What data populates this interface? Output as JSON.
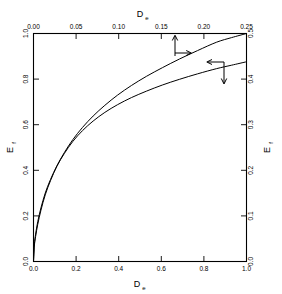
{
  "chart_data": {
    "type": "line",
    "title": "",
    "subtitle": "",
    "axes": {
      "bottom": {
        "label": "D",
        "label_sub": "e",
        "ticks": [
          "0.0",
          "0.2",
          "0.4",
          "0.6",
          "0.8",
          "1.0"
        ],
        "tick_values": [
          0.0,
          0.2,
          0.4,
          0.6,
          0.8,
          1.0
        ],
        "lim": [
          0.0,
          1.0
        ]
      },
      "top": {
        "label": "D",
        "label_sub": "e",
        "ticks": [
          "0.00",
          "0.05",
          "0.10",
          "0.15",
          "0.20",
          "0.25"
        ],
        "tick_values": [
          0.0,
          0.05,
          0.1,
          0.15,
          0.2,
          0.25
        ],
        "lim": [
          0.0,
          0.25
        ]
      },
      "left": {
        "label": "E",
        "label_sub": "f",
        "ticks": [
          "0.0",
          "0.2",
          "0.4",
          "0.6",
          "0.8",
          "1.0"
        ],
        "tick_values": [
          0.0,
          0.2,
          0.4,
          0.6,
          0.8,
          1.0
        ],
        "lim": [
          0.0,
          1.0
        ]
      },
      "right": {
        "label": "E",
        "label_sub": "f",
        "ticks": [
          "0.0",
          "0.1",
          "0.2",
          "0.3",
          "0.4",
          "0.5"
        ],
        "tick_values": [
          0.0,
          0.1,
          0.2,
          0.3,
          0.4,
          0.5
        ],
        "lim": [
          0.0,
          0.5
        ]
      }
    },
    "grid": false,
    "legend": null,
    "series": [
      {
        "name": "upper-curve",
        "axes_ref": "bottom-left",
        "x": [
          0.0,
          0.004,
          0.01,
          0.02,
          0.035,
          0.055,
          0.08,
          0.11,
          0.145,
          0.185,
          0.23,
          0.28,
          0.335,
          0.395,
          0.46,
          0.53,
          0.605,
          0.685,
          0.77,
          0.86,
          0.93,
          1.0
        ],
        "y": [
          0.0,
          0.075,
          0.12,
          0.175,
          0.235,
          0.3,
          0.36,
          0.42,
          0.478,
          0.535,
          0.588,
          0.638,
          0.685,
          0.73,
          0.772,
          0.812,
          0.85,
          0.888,
          0.925,
          0.962,
          0.982,
          1.0
        ]
      },
      {
        "name": "lower-curve",
        "axes_ref": "bottom-left",
        "x": [
          0.0,
          0.004,
          0.01,
          0.02,
          0.035,
          0.055,
          0.08,
          0.11,
          0.145,
          0.185,
          0.23,
          0.28,
          0.335,
          0.395,
          0.46,
          0.53,
          0.605,
          0.685,
          0.77,
          0.86,
          0.93,
          1.0
        ],
        "y": [
          0.0,
          0.068,
          0.11,
          0.163,
          0.225,
          0.292,
          0.355,
          0.418,
          0.474,
          0.527,
          0.574,
          0.616,
          0.654,
          0.688,
          0.719,
          0.747,
          0.774,
          0.799,
          0.823,
          0.846,
          0.861,
          0.876
        ]
      }
    ],
    "annotations": [
      {
        "name": "upper-curve-arrow",
        "kind": "axis-pointer",
        "at_x": 0.615,
        "at_y": 0.862,
        "directions": [
          "up",
          "right"
        ],
        "meaning": "upper curve reads on top and right axes"
      },
      {
        "name": "lower-curve-arrow",
        "kind": "axis-pointer",
        "at_x": 0.8,
        "at_y": 0.8,
        "directions": [
          "left",
          "down"
        ],
        "meaning": "lower curve reads on bottom and left axes"
      }
    ]
  }
}
